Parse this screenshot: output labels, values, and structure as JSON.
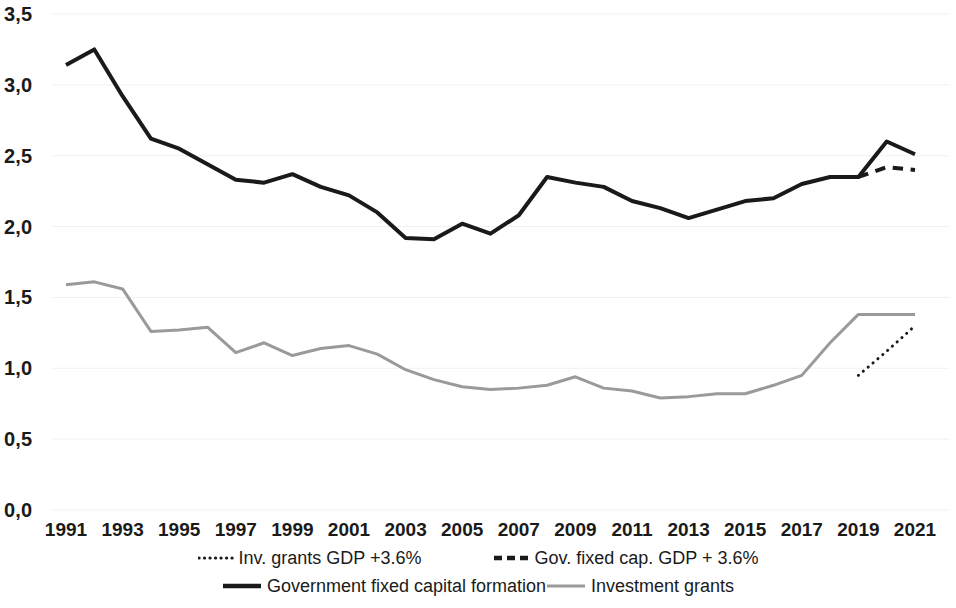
{
  "chart_data": {
    "type": "line",
    "title": "",
    "subtitle": "",
    "xlabel": "",
    "ylabel": "",
    "xlim": [
      1991,
      2021
    ],
    "ylim": [
      0.0,
      3.5
    ],
    "ytick_step": 0.5,
    "grid": "horizontal-faint",
    "legend_position": "bottom",
    "decimal_separator": ",",
    "x": [
      1991,
      1992,
      1993,
      1994,
      1995,
      1996,
      1997,
      1998,
      1999,
      2000,
      2001,
      2002,
      2003,
      2004,
      2005,
      2006,
      2007,
      2008,
      2009,
      2010,
      2011,
      2012,
      2013,
      2014,
      2015,
      2016,
      2017,
      2018,
      2019,
      2020,
      2021
    ],
    "xtick_labels": [
      "1991",
      "1993",
      "1995",
      "1997",
      "1999",
      "2001",
      "2003",
      "2005",
      "2007",
      "2009",
      "2011",
      "2013",
      "2015",
      "2017",
      "2019",
      "2021"
    ],
    "xtick_values": [
      1991,
      1993,
      1995,
      1997,
      1999,
      2001,
      2003,
      2005,
      2007,
      2009,
      2011,
      2013,
      2015,
      2017,
      2019,
      2021
    ],
    "ytick_labels": [
      "0,0",
      "0,5",
      "1,0",
      "1,5",
      "2,0",
      "2,5",
      "3,0",
      "3,5"
    ],
    "ytick_values": [
      0.0,
      0.5,
      1.0,
      1.5,
      2.0,
      2.5,
      3.0,
      3.5
    ],
    "series": [
      {
        "name": "Inv. grants GDP +3.6%",
        "style": "dotted",
        "color": "#1a1a1a",
        "width": 3,
        "x": [
          2019,
          2020,
          2021
        ],
        "values": [
          0.95,
          1.12,
          1.3
        ]
      },
      {
        "name": "Gov. fixed cap. GDP + 3.6%",
        "style": "dashed",
        "color": "#1a1a1a",
        "width": 4,
        "x": [
          2019,
          2020,
          2021
        ],
        "values": [
          2.35,
          2.42,
          2.4
        ]
      },
      {
        "name": "Government fixed capital formation",
        "style": "solid",
        "color": "#1a1a1a",
        "width": 4,
        "x": [
          1991,
          1992,
          1993,
          1994,
          1995,
          1996,
          1997,
          1998,
          1999,
          2000,
          2001,
          2002,
          2003,
          2004,
          2005,
          2006,
          2007,
          2008,
          2009,
          2010,
          2011,
          2012,
          2013,
          2014,
          2015,
          2016,
          2017,
          2018,
          2019,
          2020,
          2021
        ],
        "values": [
          3.14,
          3.25,
          2.92,
          2.62,
          2.55,
          2.44,
          2.33,
          2.31,
          2.37,
          2.28,
          2.22,
          2.1,
          1.92,
          1.91,
          2.02,
          1.95,
          2.08,
          2.35,
          2.31,
          2.28,
          2.18,
          2.13,
          2.06,
          2.12,
          2.18,
          2.2,
          2.3,
          2.35,
          2.35,
          2.6,
          2.51
        ]
      },
      {
        "name": "Investment grants",
        "style": "solid",
        "color": "#9a9a9a",
        "width": 3,
        "x": [
          1991,
          1992,
          1993,
          1994,
          1995,
          1996,
          1997,
          1998,
          1999,
          2000,
          2001,
          2002,
          2003,
          2004,
          2005,
          2006,
          2007,
          2008,
          2009,
          2010,
          2011,
          2012,
          2013,
          2014,
          2015,
          2016,
          2017,
          2018,
          2019,
          2020,
          2021
        ],
        "values": [
          1.59,
          1.61,
          1.56,
          1.26,
          1.27,
          1.29,
          1.11,
          1.18,
          1.09,
          1.14,
          1.16,
          1.1,
          0.99,
          0.92,
          0.87,
          0.85,
          0.86,
          0.88,
          0.94,
          0.86,
          0.84,
          0.79,
          0.8,
          0.82,
          0.82,
          0.88,
          0.95,
          1.18,
          1.38,
          1.38,
          1.38
        ]
      }
    ]
  },
  "legend": {
    "items": [
      {
        "label": "Inv. grants GDP +3.6%",
        "style": "dotted",
        "color": "#1a1a1a"
      },
      {
        "label": "Gov. fixed cap. GDP + 3.6%",
        "style": "dashed",
        "color": "#1a1a1a"
      },
      {
        "label": "Government fixed capital formation",
        "style": "solid",
        "color": "#1a1a1a"
      },
      {
        "label": "Investment grants",
        "style": "solid",
        "color": "#9a9a9a"
      }
    ]
  },
  "colors": {
    "background": "#ffffff",
    "text": "#1a1a1a",
    "grid": "#f1f1f1",
    "primary_line": "#1a1a1a",
    "secondary_line": "#9a9a9a"
  }
}
